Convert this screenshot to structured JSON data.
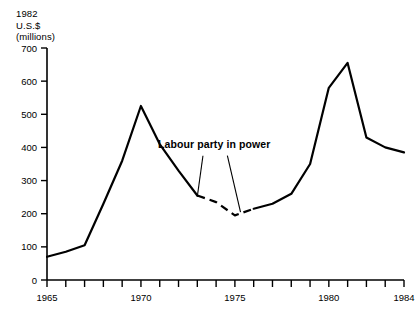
{
  "chart_data": {
    "type": "line",
    "title": "",
    "subtitle": "",
    "ylabel": "1982\nU.S.$\n(millions)",
    "xlabel": "",
    "xlim": [
      1965,
      1984
    ],
    "ylim": [
      0,
      700
    ],
    "grid": false,
    "legend": null,
    "yticks": [
      0,
      100,
      200,
      300,
      400,
      500,
      600,
      700
    ],
    "xticks": [
      1965,
      1966,
      1967,
      1968,
      1969,
      1970,
      1971,
      1972,
      1973,
      1974,
      1975,
      1976,
      1977,
      1978,
      1979,
      1980,
      1981,
      1982,
      1983,
      1984
    ],
    "xtick_labels": [
      "1965",
      "",
      "",
      "",
      "",
      "1970",
      "",
      "",
      "",
      "",
      "1975",
      "",
      "",
      "",
      "",
      "1980",
      "",
      "",
      "",
      "1984"
    ],
    "annotations": [
      {
        "text": "Labour party in power",
        "x": 1973.0,
        "y": 400,
        "leader_lines": [
          {
            "from_x": 1973.3,
            "from_y": 375,
            "to_x": 1973.0,
            "to_y": 252
          },
          {
            "from_x": 1974.6,
            "from_y": 375,
            "to_x": 1975.3,
            "to_y": 205
          }
        ]
      }
    ],
    "series": [
      {
        "name": "Real defence expenditure",
        "style": "solid-with-dashed-segment",
        "dashed_range": [
          1973.0,
          1975.3
        ],
        "x": [
          1965,
          1966,
          1967,
          1968,
          1969,
          1970,
          1971,
          1972,
          1973,
          1974,
          1975,
          1976,
          1977,
          1978,
          1979,
          1980,
          1981,
          1982,
          1983,
          1984
        ],
        "values": [
          70,
          85,
          105,
          230,
          360,
          525,
          410,
          330,
          255,
          235,
          195,
          215,
          230,
          260,
          350,
          580,
          655,
          430,
          400,
          385
        ]
      }
    ]
  }
}
